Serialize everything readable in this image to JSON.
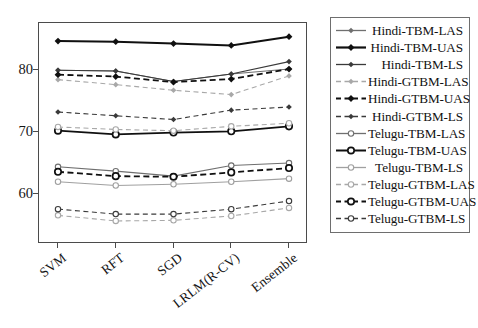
{
  "chart_data": {
    "type": "line",
    "title": "",
    "xlabel": "",
    "ylabel": "",
    "categories": [
      "SVM",
      "RFT",
      "SGD",
      "LRLM(R-CV)",
      "Ensemble"
    ],
    "ylim": [
      52,
      87.5
    ],
    "yticks": [
      60,
      70,
      80
    ],
    "grid": false,
    "legend_position": "right",
    "series": [
      {
        "name": "Hindi-TBM-LAS",
        "values": [
          79.9,
          79.8,
          78.1,
          79.3,
          80.1
        ],
        "color": "#6f6f6f",
        "dash": "solid",
        "marker": "diamond",
        "width": 1.1
      },
      {
        "name": "Hindi-TBM-UAS",
        "values": [
          84.6,
          84.5,
          84.2,
          83.9,
          85.3
        ],
        "color": "#101010",
        "dash": "solid",
        "marker": "diamond",
        "width": 2.0
      },
      {
        "name": "Hindi-TBM-LS",
        "values": [
          79.9,
          79.8,
          78.1,
          79.3,
          81.3
        ],
        "color": "#3a3a3a",
        "dash": "solid",
        "marker": "diamond",
        "width": 1.1
      },
      {
        "name": "Hindi-GTBM-LAS",
        "values": [
          78.4,
          77.6,
          76.7,
          76.0,
          79.0
        ],
        "color": "#a8a8a8",
        "dash": "dashed",
        "marker": "diamond",
        "width": 1.1
      },
      {
        "name": "Hindi-GTBM-UAS",
        "values": [
          79.2,
          78.9,
          78.0,
          78.5,
          80.1
        ],
        "color": "#101010",
        "dash": "dashed",
        "marker": "diamond",
        "width": 1.8
      },
      {
        "name": "Hindi-GTBM-LS",
        "values": [
          73.2,
          72.6,
          72.0,
          73.5,
          74.0
        ],
        "color": "#3a3a3a",
        "dash": "dashed",
        "marker": "diamond",
        "width": 1.1
      },
      {
        "name": "Telugu-TBM-LAS",
        "values": [
          64.4,
          63.7,
          62.9,
          64.6,
          65.0
        ],
        "color": "#6f6f6f",
        "dash": "solid",
        "marker": "circle",
        "width": 1.1
      },
      {
        "name": "Telugu-TBM-UAS",
        "values": [
          70.2,
          69.6,
          69.9,
          70.1,
          70.9
        ],
        "color": "#101010",
        "dash": "solid",
        "marker": "circle",
        "width": 1.8
      },
      {
        "name": "Telugu-TBM-LS",
        "values": [
          62.0,
          61.4,
          61.6,
          62.0,
          62.5
        ],
        "color": "#a0a0a0",
        "dash": "solid",
        "marker": "circle",
        "width": 1.1
      },
      {
        "name": "Telugu-GTBM-LAS",
        "values": [
          70.8,
          70.4,
          70.2,
          70.9,
          71.4
        ],
        "color": "#a8a8a8",
        "dash": "dashed",
        "marker": "circle",
        "width": 1.1
      },
      {
        "name": "Telugu-GTBM-UAS",
        "values": [
          63.6,
          62.9,
          62.8,
          63.5,
          64.2
        ],
        "color": "#101010",
        "dash": "dashed",
        "marker": "circle",
        "width": 1.8
      },
      {
        "name": "Telugu-GTBM-LS",
        "values": [
          57.6,
          56.8,
          56.8,
          57.6,
          58.9
        ],
        "color": "#3a3a3a",
        "dash": "dashed",
        "marker": "circle",
        "width": 1.1
      }
    ],
    "series_low": [
      {
        "name": "Telugu-GTBM-LS-lower",
        "values": [
          56.6,
          55.7,
          55.8,
          56.5,
          57.8
        ],
        "color": "#a8a8a8",
        "dash": "dashed",
        "marker": "circle",
        "width": 1.1
      }
    ]
  },
  "axes": {
    "y_tick_labels": [
      "80",
      "70",
      "60"
    ],
    "x_tick_labels": [
      "SVM",
      "RFT",
      "SGD",
      "LRLM(R-CV)",
      "Ensemble"
    ]
  },
  "legend": {
    "items": [
      {
        "label": "Hindi-TBM-LAS"
      },
      {
        "label": "Hindi-TBM-UAS"
      },
      {
        "label": "Hindi-TBM-LS"
      },
      {
        "label": "Hindi-GTBM-LAS"
      },
      {
        "label": "Hindi-GTBM-UAS"
      },
      {
        "label": "Hindi-GTBM-LS"
      },
      {
        "label": "Telugu-TBM-LAS"
      },
      {
        "label": "Telugu-TBM-UAS"
      },
      {
        "label": "Telugu-TBM-LS"
      },
      {
        "label": "Telugu-GTBM-LAS"
      },
      {
        "label": "Telugu-GTBM-UAS"
      },
      {
        "label": "Telugu-GTBM-LS"
      }
    ]
  }
}
